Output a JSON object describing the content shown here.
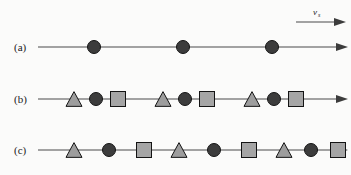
{
  "figure": {
    "background_color": "#fbfbfa",
    "line_color": "#4a4a4a",
    "outline_color": "#141414",
    "circle_fill": "#3c3c3c",
    "square_fill": "#a5a5a5",
    "triangle_fill": "#9d9d9d"
  },
  "velocity_marker": {
    "symbol": "v",
    "subscript": "s",
    "arrow_icon": "right-arrow-icon"
  },
  "rows": [
    {
      "label": "(a)",
      "label_x": 14,
      "label_y": 51,
      "line": {
        "x1": 38,
        "x2": 348,
        "y": 47
      },
      "shapes": [
        {
          "type": "circle",
          "x": 94,
          "size": 13
        },
        {
          "type": "circle",
          "x": 183,
          "size": 13
        },
        {
          "type": "circle",
          "x": 272,
          "size": 13
        }
      ]
    },
    {
      "label": "(b)",
      "label_x": 14,
      "label_y": 103,
      "line": {
        "x1": 38,
        "x2": 348,
        "y": 99
      },
      "shapes": [
        {
          "type": "triangle",
          "x": 74,
          "size": 16
        },
        {
          "type": "circle",
          "x": 96,
          "size": 13
        },
        {
          "type": "square",
          "x": 118,
          "size": 15
        },
        {
          "type": "triangle",
          "x": 163,
          "size": 16
        },
        {
          "type": "circle",
          "x": 185,
          "size": 13
        },
        {
          "type": "square",
          "x": 207,
          "size": 15
        },
        {
          "type": "triangle",
          "x": 252,
          "size": 16
        },
        {
          "type": "circle",
          "x": 274,
          "size": 13
        },
        {
          "type": "square",
          "x": 296,
          "size": 15
        }
      ]
    },
    {
      "label": "(c)",
      "label_x": 14,
      "label_y": 154,
      "line": {
        "x1": 38,
        "x2": 348,
        "y": 150
      },
      "shapes": [
        {
          "type": "triangle",
          "x": 74,
          "size": 16
        },
        {
          "type": "circle",
          "x": 109,
          "size": 13
        },
        {
          "type": "square",
          "x": 144,
          "size": 15
        },
        {
          "type": "triangle",
          "x": 179,
          "size": 16
        },
        {
          "type": "circle",
          "x": 214,
          "size": 13
        },
        {
          "type": "square",
          "x": 249,
          "size": 15
        },
        {
          "type": "triangle",
          "x": 284,
          "size": 16
        },
        {
          "type": "circle",
          "x": 311,
          "size": 13
        },
        {
          "type": "square",
          "x": 338,
          "size": 15
        }
      ]
    }
  ]
}
